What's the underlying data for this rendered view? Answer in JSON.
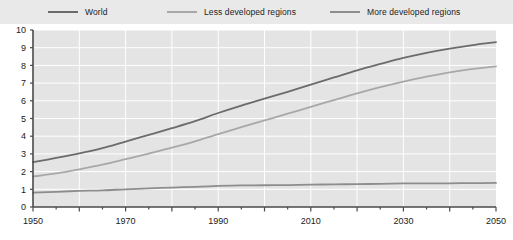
{
  "legend": {
    "position": "top",
    "background_color": "#e9e9e9",
    "entries": [
      {
        "label": "World",
        "color": "#6b6b6b",
        "icon": "line-swatch-icon"
      },
      {
        "label": "Less developed regions",
        "color": "#a8a8a8",
        "icon": "line-swatch-icon"
      },
      {
        "label": "More developed regions",
        "color": "#8d8d8d",
        "icon": "line-swatch-icon"
      }
    ]
  },
  "axes": {
    "y_tick_labels": [
      "10",
      "9",
      "8",
      "7",
      "6",
      "5",
      "4",
      "3",
      "2",
      "1",
      "0"
    ],
    "x_tick_labels": [
      "1950",
      "1970",
      "1990",
      "2010",
      "2030",
      "2050"
    ]
  },
  "style": {
    "plot_background": "#e4e4e4",
    "gridline_color": "#ffffff",
    "axis_color": "#4a4a4a"
  },
  "chart_data": {
    "type": "line",
    "title": "",
    "subtitle": "",
    "xlabel": "",
    "ylabel": "",
    "xlim": [
      1950,
      2050
    ],
    "ylim": [
      0,
      10
    ],
    "x_ticks": [
      1950,
      1970,
      1990,
      2010,
      2030,
      2050
    ],
    "x_minor_tick_interval": 5,
    "y_ticks": [
      0,
      1,
      2,
      3,
      4,
      5,
      6,
      7,
      8,
      9,
      10
    ],
    "grid": true,
    "legend_position": "top",
    "x": [
      1950,
      1955,
      1960,
      1965,
      1970,
      1975,
      1980,
      1985,
      1990,
      1995,
      2000,
      2005,
      2010,
      2015,
      2020,
      2025,
      2030,
      2035,
      2040,
      2045,
      2050
    ],
    "series": [
      {
        "name": "World",
        "color": "#6b6b6b",
        "values": [
          2.53,
          2.77,
          3.03,
          3.33,
          3.7,
          4.07,
          4.45,
          4.85,
          5.31,
          5.73,
          6.12,
          6.51,
          6.92,
          7.32,
          7.72,
          8.08,
          8.42,
          8.71,
          8.95,
          9.15,
          9.31
        ]
      },
      {
        "name": "Less developed regions",
        "color": "#a8a8a8",
        "values": [
          1.72,
          1.9,
          2.13,
          2.39,
          2.7,
          3.02,
          3.35,
          3.71,
          4.12,
          4.51,
          4.89,
          5.27,
          5.66,
          6.04,
          6.42,
          6.77,
          7.09,
          7.37,
          7.61,
          7.8,
          7.95
        ]
      },
      {
        "name": "More developed regions",
        "color": "#8d8d8d",
        "values": [
          0.81,
          0.86,
          0.91,
          0.94,
          1.0,
          1.05,
          1.1,
          1.14,
          1.19,
          1.22,
          1.23,
          1.24,
          1.26,
          1.28,
          1.29,
          1.31,
          1.33,
          1.34,
          1.34,
          1.35,
          1.36
        ]
      }
    ]
  }
}
